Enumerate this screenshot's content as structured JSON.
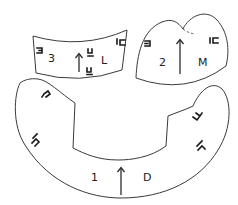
{
  "diagram": {
    "type": "sewing-pattern-pieces",
    "pieces": [
      {
        "id": "piece-1",
        "number": "1",
        "letter": "D",
        "grainline": "arrow-up",
        "notches": 4,
        "shape": "large crescent with rectangular cut-out on top"
      },
      {
        "id": "piece-2",
        "number": "2",
        "letter": "M",
        "grainline": "arrow-up",
        "notches": 2,
        "shape": "two-lobed cap with curved bottom edge and dashed fold line"
      },
      {
        "id": "piece-3",
        "number": "3",
        "letter": "L",
        "grainline": "arrow-up",
        "notches": 4,
        "shape": "curved band / strip"
      }
    ],
    "colors": {
      "outline": "#3a3a3a",
      "text": "#222222",
      "background": "#ffffff"
    }
  }
}
